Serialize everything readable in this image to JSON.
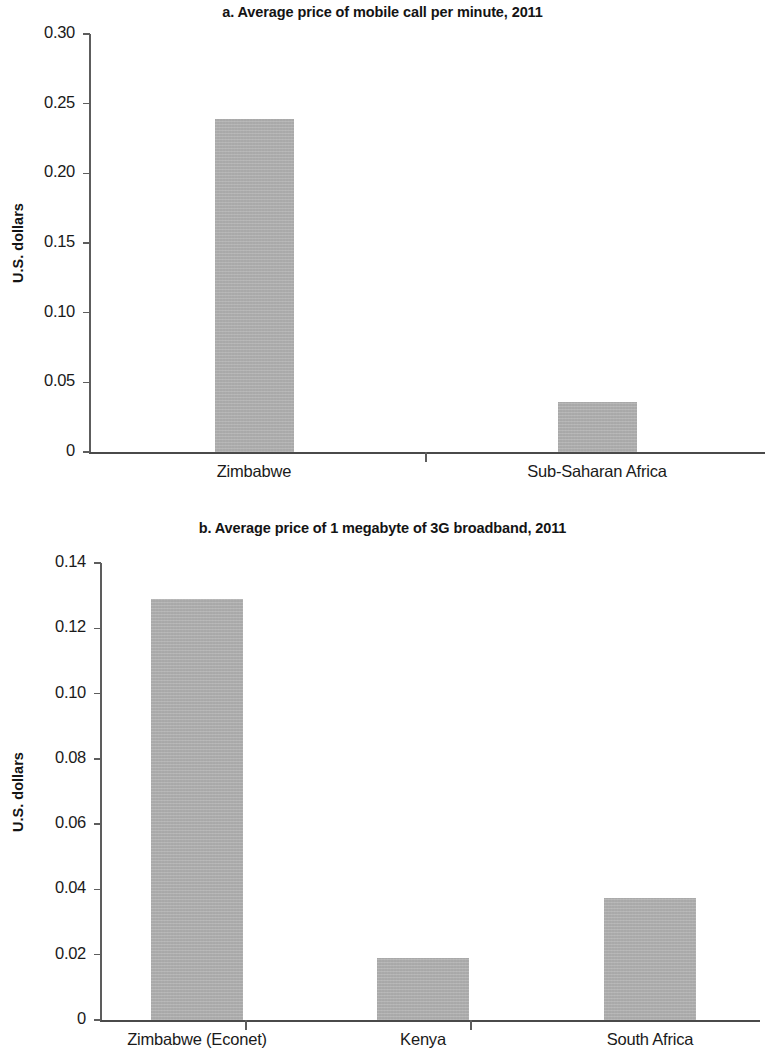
{
  "page": {
    "background_color": "#ffffff",
    "bar_color": "#adadad",
    "axis_color": "#5d5d5d",
    "text_color": "#1a1a1a"
  },
  "chart_data": [
    {
      "type": "bar",
      "panel_label": "a.",
      "title": "a. Average price of mobile call per minute, 2011",
      "xlabel": "",
      "ylabel": "U.S. dollars",
      "categories": [
        "Zimbabwe",
        "Sub-Saharan Africa"
      ],
      "values": [
        0.239,
        0.036
      ],
      "ylim": [
        0,
        0.3
      ],
      "ytick_values": [
        0,
        0.05,
        0.1,
        0.15,
        0.2,
        0.25,
        0.3
      ],
      "ytick_labels": [
        "0",
        "0.05",
        "0.10",
        "0.15",
        "0.20",
        "0.25",
        "0.30"
      ],
      "grid": false,
      "legend": false
    },
    {
      "type": "bar",
      "panel_label": "b.",
      "title": "b. Average price of 1 megabyte of 3G broadband, 2011",
      "xlabel": "",
      "ylabel": "U.S. dollars",
      "categories": [
        "Zimbabwe (Econet)",
        "Kenya",
        "South Africa"
      ],
      "values": [
        0.129,
        0.019,
        0.0375
      ],
      "ylim": [
        0,
        0.14
      ],
      "ytick_values": [
        0,
        0.02,
        0.04,
        0.06,
        0.08,
        0.1,
        0.12,
        0.14
      ],
      "ytick_labels": [
        "0",
        "0.02",
        "0.04",
        "0.06",
        "0.08",
        "0.10",
        "0.12",
        "0.14"
      ],
      "grid": false,
      "legend": false
    }
  ]
}
